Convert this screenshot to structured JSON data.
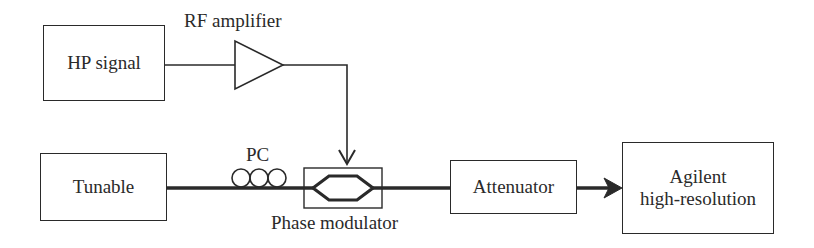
{
  "diagram": {
    "colors": {
      "stroke": "#2a2a2a",
      "background": "#ffffff"
    },
    "blocks": {
      "hp_signal": {
        "label": "HP signal"
      },
      "tunable": {
        "label": "Tunable"
      },
      "attenuator": {
        "label": "Attenuator"
      },
      "agilent": {
        "label_line1": "Agilent",
        "label_line2": "high-resolution"
      }
    },
    "components": {
      "rf_amplifier": {
        "label": "RF amplifier",
        "symbol": "triangle-amplifier-icon"
      },
      "pc": {
        "label": "PC",
        "symbol": "polarization-controller-coils-icon"
      },
      "phase_modulator": {
        "label": "Phase modulator",
        "symbol": "mach-zehnder-waveguide-icon"
      }
    },
    "connections": [
      {
        "from": "HP signal",
        "to": "RF amplifier",
        "type": "electrical"
      },
      {
        "from": "RF amplifier",
        "to": "Phase modulator",
        "type": "electrical-arrow"
      },
      {
        "from": "Tunable",
        "to": "PC",
        "type": "optical-fiber"
      },
      {
        "from": "PC",
        "to": "Phase modulator",
        "type": "optical-fiber"
      },
      {
        "from": "Phase modulator",
        "to": "Attenuator",
        "type": "optical-fiber"
      },
      {
        "from": "Attenuator",
        "to": "Agilent high-resolution",
        "type": "optical-fiber-arrow"
      }
    ]
  }
}
